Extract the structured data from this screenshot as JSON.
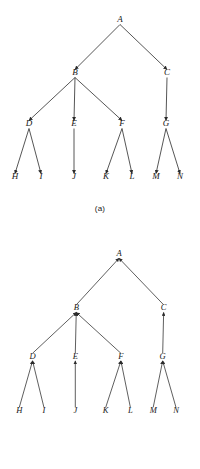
{
  "figure": {
    "background_color": "#ffffff",
    "ink_color": "#2b2b2b",
    "panels": [
      {
        "id": "a",
        "caption": "(a)",
        "edge_direction": "parent-to-child",
        "arrowhead_at": "child",
        "nodes": [
          {
            "label": "A",
            "x": 120,
            "y": 22,
            "level": 0
          },
          {
            "label": "B",
            "x": 75,
            "y": 75,
            "level": 1
          },
          {
            "label": "C",
            "x": 167,
            "y": 75,
            "level": 1
          },
          {
            "label": "D",
            "x": 29,
            "y": 126,
            "level": 2
          },
          {
            "label": "E",
            "x": 74,
            "y": 126,
            "level": 2
          },
          {
            "label": "F",
            "x": 122,
            "y": 126,
            "level": 2
          },
          {
            "label": "G",
            "x": 166,
            "y": 126,
            "level": 2
          },
          {
            "label": "H",
            "x": 15,
            "y": 179,
            "level": 3
          },
          {
            "label": "I",
            "x": 41,
            "y": 179,
            "level": 3
          },
          {
            "label": "J",
            "x": 74,
            "y": 179,
            "level": 3
          },
          {
            "label": "K",
            "x": 106,
            "y": 179,
            "level": 3
          },
          {
            "label": "L",
            "x": 132,
            "y": 179,
            "level": 3
          },
          {
            "label": "M",
            "x": 156,
            "y": 179,
            "level": 3
          },
          {
            "label": "N",
            "x": 180,
            "y": 179,
            "level": 3
          }
        ],
        "edges": [
          {
            "from": "A",
            "to": "B"
          },
          {
            "from": "A",
            "to": "C"
          },
          {
            "from": "B",
            "to": "D"
          },
          {
            "from": "B",
            "to": "E"
          },
          {
            "from": "B",
            "to": "F"
          },
          {
            "from": "C",
            "to": "G"
          },
          {
            "from": "D",
            "to": "H"
          },
          {
            "from": "D",
            "to": "I"
          },
          {
            "from": "E",
            "to": "J"
          },
          {
            "from": "F",
            "to": "K"
          },
          {
            "from": "F",
            "to": "L"
          },
          {
            "from": "G",
            "to": "M"
          },
          {
            "from": "G",
            "to": "N"
          }
        ]
      },
      {
        "id": "b",
        "caption": "(b)",
        "edge_direction": "child-to-parent",
        "arrowhead_at": "parent",
        "nodes": [
          {
            "label": "A",
            "x": 120,
            "y": 22,
            "level": 0
          },
          {
            "label": "B",
            "x": 75,
            "y": 79,
            "level": 1
          },
          {
            "label": "C",
            "x": 167,
            "y": 79,
            "level": 1
          },
          {
            "label": "D",
            "x": 29,
            "y": 130,
            "level": 2
          },
          {
            "label": "E",
            "x": 74,
            "y": 130,
            "level": 2
          },
          {
            "label": "F",
            "x": 122,
            "y": 130,
            "level": 2
          },
          {
            "label": "G",
            "x": 166,
            "y": 130,
            "level": 2
          },
          {
            "label": "H",
            "x": 15,
            "y": 187,
            "level": 3
          },
          {
            "label": "I",
            "x": 41,
            "y": 187,
            "level": 3
          },
          {
            "label": "J",
            "x": 74,
            "y": 187,
            "level": 3
          },
          {
            "label": "K",
            "x": 106,
            "y": 187,
            "level": 3
          },
          {
            "label": "L",
            "x": 132,
            "y": 187,
            "level": 3
          },
          {
            "label": "M",
            "x": 156,
            "y": 187,
            "level": 3
          },
          {
            "label": "N",
            "x": 180,
            "y": 187,
            "level": 3
          }
        ],
        "edges": [
          {
            "from": "B",
            "to": "A"
          },
          {
            "from": "C",
            "to": "A"
          },
          {
            "from": "D",
            "to": "B"
          },
          {
            "from": "E",
            "to": "B"
          },
          {
            "from": "F",
            "to": "B"
          },
          {
            "from": "G",
            "to": "C"
          },
          {
            "from": "H",
            "to": "D"
          },
          {
            "from": "I",
            "to": "D"
          },
          {
            "from": "J",
            "to": "E"
          },
          {
            "from": "K",
            "to": "F"
          },
          {
            "from": "L",
            "to": "F"
          },
          {
            "from": "M",
            "to": "G"
          },
          {
            "from": "N",
            "to": "G"
          }
        ]
      }
    ]
  }
}
